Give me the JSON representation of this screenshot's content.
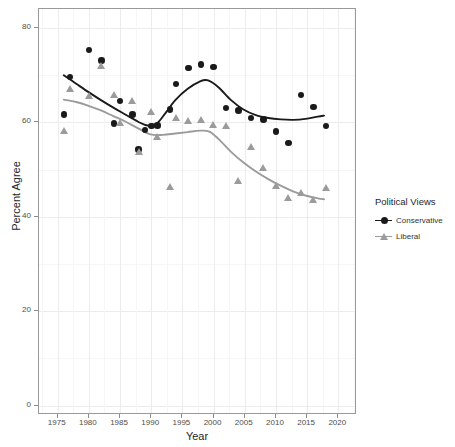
{
  "chart_data": {
    "type": "scatter",
    "title": "",
    "xlabel": "Year",
    "ylabel": "Percent Agree",
    "xlim": [
      1972,
      2023
    ],
    "ylim": [
      -2,
      84
    ],
    "xticks": [
      1975,
      1980,
      1985,
      1990,
      1995,
      2000,
      2005,
      2010,
      2015,
      2020
    ],
    "yticks": [
      0,
      20,
      40,
      60,
      80
    ],
    "grid": true,
    "legend": {
      "title": "Political Views",
      "position": "right",
      "entries": [
        {
          "label": "Conservative",
          "color": "#1a1a1a",
          "marker": "circle"
        },
        {
          "label": "Liberal",
          "color": "#9b9b9b",
          "marker": "triangle"
        }
      ]
    },
    "series": [
      {
        "name": "Conservative",
        "color": "#1a1a1a",
        "marker": "circle",
        "points": [
          {
            "x": 1976,
            "y": 61.7
          },
          {
            "x": 1977,
            "y": 69.6
          },
          {
            "x": 1980,
            "y": 75.3
          },
          {
            "x": 1982,
            "y": 73.1
          },
          {
            "x": 1984,
            "y": 59.7
          },
          {
            "x": 1985,
            "y": 64.5
          },
          {
            "x": 1987,
            "y": 61.6
          },
          {
            "x": 1988,
            "y": 54.3
          },
          {
            "x": 1989,
            "y": 58.4
          },
          {
            "x": 1990,
            "y": 59.2
          },
          {
            "x": 1991,
            "y": 59.3
          },
          {
            "x": 1993,
            "y": 62.7
          },
          {
            "x": 1994,
            "y": 68.1
          },
          {
            "x": 1996,
            "y": 71.5
          },
          {
            "x": 1998,
            "y": 72.3
          },
          {
            "x": 2000,
            "y": 71.7
          },
          {
            "x": 2002,
            "y": 63.0
          },
          {
            "x": 2004,
            "y": 62.5
          },
          {
            "x": 2006,
            "y": 60.9
          },
          {
            "x": 2008,
            "y": 60.6
          },
          {
            "x": 2010,
            "y": 58.1
          },
          {
            "x": 2012,
            "y": 55.6
          },
          {
            "x": 2014,
            "y": 65.8
          },
          {
            "x": 2016,
            "y": 63.2
          },
          {
            "x": 2018,
            "y": 59.2
          }
        ],
        "smooth": [
          {
            "x": 1976,
            "y": 69.9
          },
          {
            "x": 1978,
            "y": 68.1
          },
          {
            "x": 1980,
            "y": 66.3
          },
          {
            "x": 1982,
            "y": 64.6
          },
          {
            "x": 1984,
            "y": 63.0
          },
          {
            "x": 1986,
            "y": 61.5
          },
          {
            "x": 1988,
            "y": 60.0
          },
          {
            "x": 1989.5,
            "y": 59.2
          },
          {
            "x": 1991,
            "y": 59.6
          },
          {
            "x": 1992.5,
            "y": 62.0
          },
          {
            "x": 1994,
            "y": 64.6
          },
          {
            "x": 1996,
            "y": 67.0
          },
          {
            "x": 1998,
            "y": 68.6
          },
          {
            "x": 1999.3,
            "y": 68.8
          },
          {
            "x": 2001,
            "y": 67.3
          },
          {
            "x": 2003,
            "y": 64.6
          },
          {
            "x": 2005,
            "y": 62.6
          },
          {
            "x": 2007,
            "y": 61.4
          },
          {
            "x": 2009,
            "y": 60.8
          },
          {
            "x": 2011,
            "y": 60.5
          },
          {
            "x": 2013,
            "y": 60.4
          },
          {
            "x": 2015,
            "y": 60.6
          },
          {
            "x": 2017,
            "y": 61.1
          },
          {
            "x": 2018,
            "y": 61.3
          }
        ]
      },
      {
        "name": "Liberal",
        "color": "#9b9b9b",
        "marker": "triangle",
        "points": [
          {
            "x": 1976,
            "y": 58.3
          },
          {
            "x": 1977,
            "y": 67.3
          },
          {
            "x": 1980,
            "y": 65.8
          },
          {
            "x": 1982,
            "y": 72.2
          },
          {
            "x": 1984,
            "y": 66.0
          },
          {
            "x": 1985,
            "y": 60.1
          },
          {
            "x": 1987,
            "y": 64.6
          },
          {
            "x": 1988,
            "y": 53.8
          },
          {
            "x": 1990,
            "y": 62.4
          },
          {
            "x": 1991,
            "y": 57.0
          },
          {
            "x": 1993,
            "y": 46.5
          },
          {
            "x": 1994,
            "y": 61.0
          },
          {
            "x": 1996,
            "y": 60.5
          },
          {
            "x": 1998,
            "y": 60.6
          },
          {
            "x": 2000,
            "y": 59.7
          },
          {
            "x": 2002,
            "y": 59.3
          },
          {
            "x": 2004,
            "y": 47.8
          },
          {
            "x": 2006,
            "y": 54.9
          },
          {
            "x": 2008,
            "y": 50.5
          },
          {
            "x": 2010,
            "y": 46.6
          },
          {
            "x": 2012,
            "y": 44.2
          },
          {
            "x": 2014,
            "y": 45.3
          },
          {
            "x": 2016,
            "y": 43.8
          },
          {
            "x": 2018,
            "y": 46.3
          }
        ],
        "smooth": [
          {
            "x": 1976,
            "y": 64.7
          },
          {
            "x": 1978,
            "y": 64.2
          },
          {
            "x": 1980,
            "y": 63.4
          },
          {
            "x": 1982,
            "y": 62.4
          },
          {
            "x": 1984,
            "y": 61.2
          },
          {
            "x": 1986,
            "y": 60.0
          },
          {
            "x": 1988,
            "y": 58.6
          },
          {
            "x": 1990,
            "y": 57.3
          },
          {
            "x": 1992,
            "y": 57.2
          },
          {
            "x": 1994,
            "y": 57.5
          },
          {
            "x": 1996,
            "y": 57.8
          },
          {
            "x": 1998,
            "y": 58.1
          },
          {
            "x": 1999.5,
            "y": 57.9
          },
          {
            "x": 2001,
            "y": 56.3
          },
          {
            "x": 2003,
            "y": 53.6
          },
          {
            "x": 2005,
            "y": 51.3
          },
          {
            "x": 2007,
            "y": 49.4
          },
          {
            "x": 2009,
            "y": 47.8
          },
          {
            "x": 2011,
            "y": 46.4
          },
          {
            "x": 2013,
            "y": 45.2
          },
          {
            "x": 2015,
            "y": 44.3
          },
          {
            "x": 2017,
            "y": 43.7
          },
          {
            "x": 2018,
            "y": 43.5
          }
        ]
      }
    ]
  }
}
